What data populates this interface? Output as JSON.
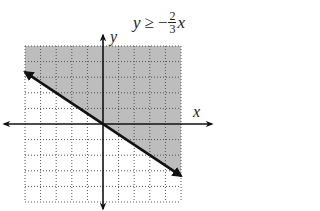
{
  "title": {
    "lhs": "y",
    "relation": "≥",
    "sign": "−",
    "numerator": "2",
    "denominator": "3",
    "var": "x"
  },
  "axes": {
    "x_label": "x",
    "y_label": "y"
  },
  "colors": {
    "shade": "#bdbdbd",
    "grid": "#555555",
    "line": "#111111",
    "axis": "#111111"
  },
  "chart_data": {
    "type": "area",
    "xlabel": "x",
    "ylabel": "y",
    "xlim": [
      -5,
      5
    ],
    "ylim": [
      -5,
      5
    ],
    "grid": true,
    "grid_style": "dotted",
    "boundary_line": {
      "slope": -0.6667,
      "intercept": 0,
      "style": "solid",
      "arrows": "both",
      "endpoints": [
        [
          -5,
          3.33
        ],
        [
          5,
          -3.33
        ]
      ]
    },
    "shaded_region": "above line (y ≥ −2/3 x)",
    "legend": null
  }
}
